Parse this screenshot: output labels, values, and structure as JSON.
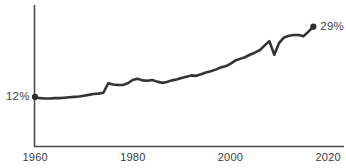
{
  "chart_data": {
    "type": "line",
    "title": "",
    "subtitle": "",
    "xlabel": "",
    "ylabel": "",
    "xlim": [
      1960,
      2020
    ],
    "ylim": [
      0,
      34
    ],
    "grid": false,
    "legend": null,
    "x_ticks": [
      "1960",
      "1980",
      "2000",
      "2020"
    ],
    "x_tick_values": [
      1960,
      1980,
      2000,
      2020
    ],
    "y_ticks": [],
    "annotations": [
      {
        "name": "start-value",
        "text": "12%",
        "x": 1960,
        "y": 12
      },
      {
        "name": "end-value",
        "text": "29%",
        "x": 2017,
        "y": 29
      }
    ],
    "markers": [
      {
        "name": "start-point",
        "x": 1960,
        "y": 12
      },
      {
        "name": "end-point",
        "x": 2017,
        "y": 29
      }
    ],
    "series": [
      {
        "name": "value",
        "color": "#333333",
        "x": [
          1960,
          1961,
          1962,
          1963,
          1964,
          1965,
          1966,
          1967,
          1968,
          1969,
          1970,
          1971,
          1972,
          1973,
          1974,
          1975,
          1976,
          1977,
          1978,
          1979,
          1980,
          1981,
          1982,
          1983,
          1984,
          1985,
          1986,
          1987,
          1988,
          1989,
          1990,
          1991,
          1992,
          1993,
          1994,
          1995,
          1996,
          1997,
          1998,
          1999,
          2000,
          2001,
          2002,
          2003,
          2004,
          2005,
          2006,
          2007,
          2008,
          2009,
          2010,
          2011,
          2012,
          2013,
          2014,
          2015,
          2016,
          2017
        ],
        "y": [
          12.0,
          11.7,
          11.6,
          11.6,
          11.7,
          11.7,
          11.8,
          11.9,
          12.0,
          12.1,
          12.3,
          12.5,
          12.7,
          12.8,
          13.0,
          15.3,
          15.0,
          14.9,
          14.9,
          15.3,
          16.1,
          16.4,
          16.0,
          15.9,
          16.1,
          15.7,
          15.4,
          15.6,
          16.0,
          16.2,
          16.6,
          16.9,
          17.2,
          17.1,
          17.5,
          17.9,
          18.2,
          18.6,
          19.1,
          19.4,
          20.0,
          20.8,
          21.2,
          21.6,
          22.2,
          22.7,
          23.3,
          24.4,
          25.5,
          22.2,
          25.1,
          26.4,
          26.8,
          27.0,
          27.0,
          26.7,
          27.8,
          29.0
        ]
      }
    ]
  },
  "axes": {
    "y_axis_name": "y-axis-line",
    "x_axis_name": "x-axis-line"
  }
}
